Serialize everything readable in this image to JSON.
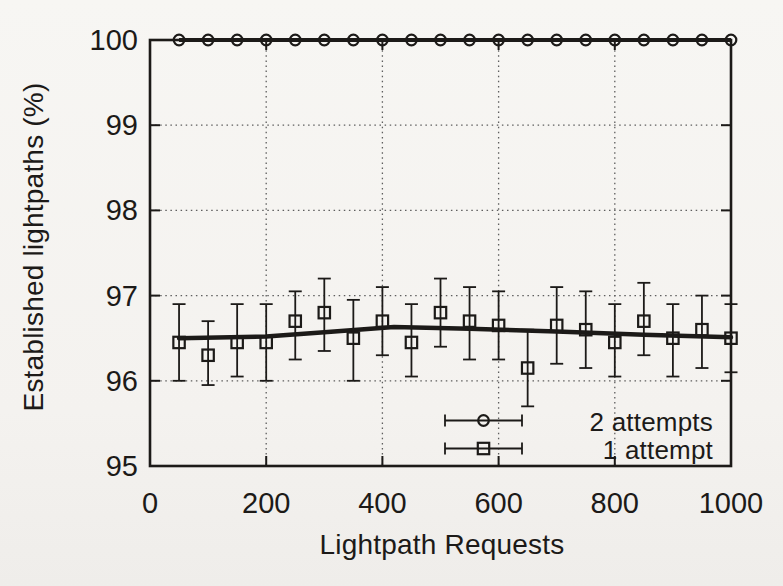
{
  "figure": {
    "background": "#f5f3f0",
    "ink": "#1c1a18",
    "grid_color": "#5e5e5e"
  },
  "legend": {
    "entries": [
      {
        "label": "2 attempts",
        "marker": "circle-errorbar-sample"
      },
      {
        "label": "1 attempt",
        "marker": "square-errorbar-sample"
      }
    ],
    "position": "inside bottom-right"
  },
  "chart_data": {
    "type": "line",
    "title": "",
    "xlabel": "Lightpath Requests",
    "ylabel": "Established lightpaths (%)",
    "xlim": [
      0,
      1000
    ],
    "ylim": [
      95,
      100
    ],
    "xticks": [
      0,
      200,
      400,
      600,
      800,
      1000
    ],
    "yticks": [
      95,
      96,
      97,
      98,
      99,
      100
    ],
    "grid_x": [
      200,
      400,
      600,
      800
    ],
    "grid_y": [
      96,
      97,
      98,
      99
    ],
    "grid_style": "dotted",
    "legend_position": "inside bottom-right",
    "x": [
      50,
      100,
      150,
      200,
      250,
      300,
      350,
      400,
      450,
      500,
      550,
      600,
      650,
      700,
      750,
      800,
      850,
      900,
      950,
      1000
    ],
    "series": [
      {
        "name": "2 attempts",
        "marker": "circle",
        "values": [
          100,
          100,
          100,
          100,
          100,
          100,
          100,
          100,
          100,
          100,
          100,
          100,
          100,
          100,
          100,
          100,
          100,
          100,
          100,
          100
        ]
      },
      {
        "name": "1 attempt",
        "marker": "square",
        "values": [
          96.45,
          96.3,
          96.45,
          96.45,
          96.7,
          96.8,
          96.5,
          96.7,
          96.45,
          96.8,
          96.7,
          96.65,
          96.15,
          96.65,
          96.6,
          96.45,
          96.7,
          96.5,
          96.6,
          96.5
        ],
        "err_low": [
          96.0,
          95.95,
          96.05,
          96.0,
          96.25,
          96.35,
          96.0,
          96.3,
          96.05,
          96.4,
          96.25,
          96.25,
          95.7,
          96.2,
          96.15,
          96.05,
          96.3,
          96.05,
          96.15,
          96.1
        ],
        "err_high": [
          96.9,
          96.7,
          96.9,
          96.9,
          97.05,
          97.2,
          96.95,
          97.1,
          96.9,
          97.2,
          97.1,
          97.05,
          96.6,
          97.1,
          97.05,
          96.9,
          97.15,
          96.9,
          97.0,
          96.9
        ],
        "trend": [
          [
            50,
            96.5
          ],
          [
            200,
            96.52
          ],
          [
            300,
            96.57
          ],
          [
            420,
            96.63
          ],
          [
            550,
            96.61
          ],
          [
            700,
            96.58
          ],
          [
            850,
            96.54
          ],
          [
            1000,
            96.51
          ]
        ]
      }
    ]
  }
}
